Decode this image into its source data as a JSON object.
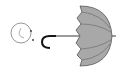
{
  "image": {
    "description": "Clip-art: a smiling face outline next to a gray umbrella lying sideways with a hooked handle",
    "colors": {
      "background": "#ffffff",
      "outline": "#1a1a1a",
      "face_outline": "#8a8a8a",
      "canopy_fill": "#a8a8a8",
      "canopy_rib": "#6e6e6e"
    },
    "elements": [
      {
        "name": "smiley-face",
        "shape": "circle"
      },
      {
        "name": "umbrella",
        "shape": "canopy-with-hook-handle"
      }
    ]
  }
}
